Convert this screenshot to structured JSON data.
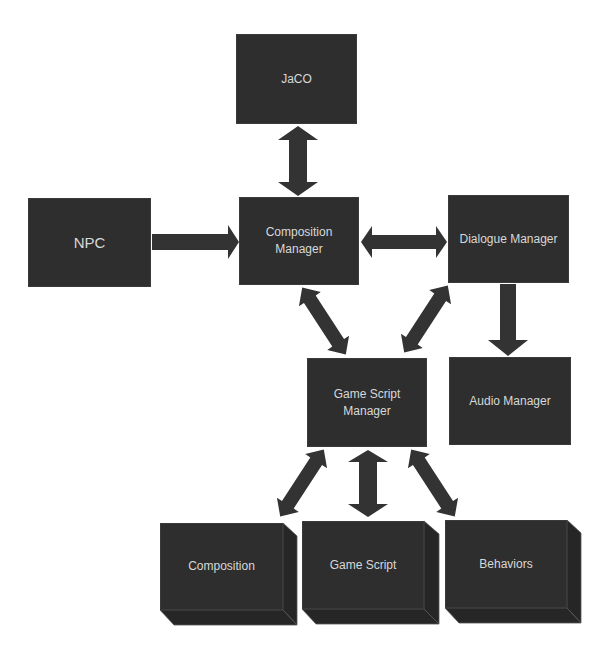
{
  "diagram": {
    "colors": {
      "box_fill": "#2e2e2e",
      "box_text": "#d8d8d8",
      "arrow_fill": "#333333",
      "background": "#ffffff"
    },
    "nodes": [
      {
        "id": "jaco",
        "label": "JaCO"
      },
      {
        "id": "npc",
        "label": "NPC"
      },
      {
        "id": "composition_manager",
        "label": "Composition\nManager"
      },
      {
        "id": "dialogue_manager",
        "label": "Dialogue Manager"
      },
      {
        "id": "game_script_manager",
        "label": "Game Script\nManager"
      },
      {
        "id": "audio_manager",
        "label": "Audio Manager"
      },
      {
        "id": "composition",
        "label": "Composition",
        "shape": "3d-box"
      },
      {
        "id": "game_script",
        "label": "Game Script",
        "shape": "3d-box"
      },
      {
        "id": "behaviors",
        "label": "Behaviors",
        "shape": "3d-box"
      }
    ],
    "edges": [
      {
        "from": "jaco",
        "to": "composition_manager",
        "direction": "both"
      },
      {
        "from": "npc",
        "to": "composition_manager",
        "direction": "forward"
      },
      {
        "from": "composition_manager",
        "to": "dialogue_manager",
        "direction": "both"
      },
      {
        "from": "composition_manager",
        "to": "game_script_manager",
        "direction": "both"
      },
      {
        "from": "dialogue_manager",
        "to": "game_script_manager",
        "direction": "both"
      },
      {
        "from": "dialogue_manager",
        "to": "audio_manager",
        "direction": "forward"
      },
      {
        "from": "game_script_manager",
        "to": "composition",
        "direction": "both"
      },
      {
        "from": "game_script_manager",
        "to": "game_script",
        "direction": "both"
      },
      {
        "from": "game_script_manager",
        "to": "behaviors",
        "direction": "both"
      }
    ]
  }
}
